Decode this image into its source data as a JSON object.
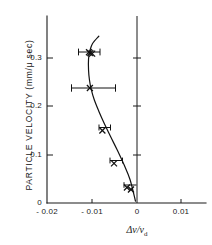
{
  "chart_data": {
    "type": "scatter",
    "title": "",
    "xlabel": "Δν/ν",
    "xlabel_subscript": "d",
    "ylabel": "PARTICLE VELOCITY  (mm/μ sec)",
    "xlim": [
      -0.02,
      0.0125
    ],
    "ylim": [
      0,
      0.345
    ],
    "xticks": [
      -0.02,
      -0.01,
      0,
      0.01
    ],
    "xtick_labels": [
      "- 0.02",
      "- 0.01",
      "0",
      "0.01"
    ],
    "yticks": [
      0,
      0.1,
      0.2,
      0.3
    ],
    "ytick_labels": [
      "0",
      "0.1",
      "0.2",
      "0.3"
    ],
    "grid": false,
    "legend": "none",
    "reference_line_x": 0,
    "marker_style": "x",
    "series": [
      {
        "name": "measurements",
        "x": [
          -0.0106,
          -0.0103,
          -0.0099,
          -0.0104,
          -0.0076,
          -0.005,
          -0.0021,
          -0.0012
        ],
        "y": [
          0.312,
          0.31,
          0.309,
          0.238,
          0.15,
          0.082,
          0.032,
          0.028
        ],
        "xerr": [
          0.0012,
          0.0012,
          0.0012,
          0.0027,
          0.0008,
          0.0006,
          0.0005,
          0.0005
        ]
      }
    ],
    "fit_curve": {
      "name": "fitted curve",
      "x": [
        -0.0084,
        -0.0098,
        -0.0104,
        -0.0107,
        -0.0107,
        -0.0105,
        -0.0101,
        -0.0094,
        -0.0084,
        -0.0072,
        -0.0058,
        -0.0043,
        -0.0028,
        -0.0014,
        -0.0002
      ],
      "y": [
        0.345,
        0.33,
        0.315,
        0.298,
        0.275,
        0.255,
        0.235,
        0.213,
        0.19,
        0.165,
        0.138,
        0.11,
        0.08,
        0.048,
        0.004
      ]
    }
  }
}
